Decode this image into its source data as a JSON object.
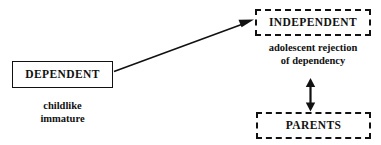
{
  "diagram": {
    "background_color": "#ffffff",
    "stroke_color": "#111111",
    "nodes": [
      {
        "id": "dependent",
        "label": "DEPENDENT",
        "border_style": "solid",
        "caption_lines": [
          "childlike",
          "immature"
        ]
      },
      {
        "id": "independent",
        "label": "INDEPENDENT",
        "border_style": "dashed",
        "caption_lines": [
          "adolescent rejection",
          "of dependency"
        ]
      },
      {
        "id": "parents",
        "label": "PARENTS",
        "border_style": "dashed",
        "caption_lines": []
      }
    ],
    "connectors": [
      {
        "id": "dependent-to-independent",
        "from": "dependent",
        "to": "independent",
        "style": "single-headed-diagonal-arrow",
        "direction": "up-right"
      },
      {
        "id": "independent-parents",
        "from": "parents",
        "to": "independent",
        "style": "double-headed-vertical-arrow",
        "direction": "both"
      }
    ]
  }
}
